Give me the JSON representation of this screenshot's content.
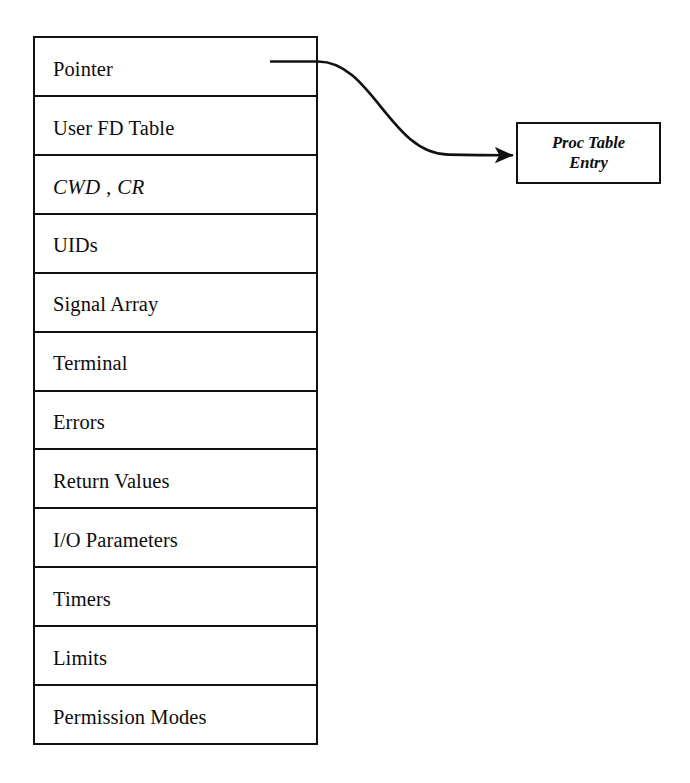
{
  "diagram": {
    "struct_table": {
      "name": "user-structure-table",
      "rows": [
        {
          "label": "Pointer",
          "style": "roman"
        },
        {
          "label": "User FD Table",
          "style": "roman"
        },
        {
          "label": "CWD , CR",
          "style": "italic"
        },
        {
          "label": "UIDs",
          "style": "roman"
        },
        {
          "label": "Signal Array",
          "style": "roman"
        },
        {
          "label": "Terminal",
          "style": "roman"
        },
        {
          "label": "Errors",
          "style": "roman"
        },
        {
          "label": "Return Values",
          "style": "roman"
        },
        {
          "label": "I/O Parameters",
          "style": "roman"
        },
        {
          "label": "Timers",
          "style": "roman"
        },
        {
          "label": "Limits",
          "style": "roman"
        },
        {
          "label": "Permission Modes",
          "style": "roman"
        }
      ]
    },
    "proc_box": {
      "line1": "Proc Table",
      "line2": "Entry"
    },
    "connector": {
      "from_row_label": "Pointer",
      "to_box_label": "Proc Table Entry",
      "arrowhead": "filled-triangle"
    },
    "colors": {
      "stroke": "#111111",
      "background": "#ffffff",
      "text": "#0d0d0d"
    }
  }
}
